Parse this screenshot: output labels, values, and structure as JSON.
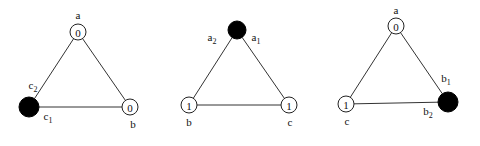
{
  "diagram": {
    "type": "three triangle graphs",
    "triangles": [
      {
        "id": "t1",
        "nodes": [
          {
            "name": "a",
            "value": "0",
            "filled": false,
            "x": 78,
            "y": 32,
            "r": 8,
            "label": "a",
            "label_x": 78,
            "label_y": 19
          },
          {
            "name": "b",
            "value": "0",
            "filled": false,
            "x": 130,
            "y": 107,
            "r": 8,
            "label": "b",
            "label_x": 133,
            "label_y": 128
          },
          {
            "name": "c",
            "value": "",
            "filled": true,
            "x": 29,
            "y": 107,
            "r": 10
          }
        ],
        "extra_labels": [
          {
            "text": "c",
            "sub": "2",
            "x": 33,
            "y": 89
          },
          {
            "text": "c",
            "sub": "1",
            "x": 48,
            "y": 120
          }
        ]
      },
      {
        "id": "t2",
        "nodes": [
          {
            "name": "a",
            "value": "",
            "filled": true,
            "x": 237,
            "y": 30,
            "r": 9
          },
          {
            "name": "b",
            "value": "1",
            "filled": false,
            "x": 189,
            "y": 105,
            "r": 8,
            "label": "b",
            "label_x": 189,
            "label_y": 126
          },
          {
            "name": "c",
            "value": "1",
            "filled": false,
            "x": 289,
            "y": 105,
            "r": 8,
            "label": "c",
            "label_x": 290,
            "label_y": 126
          }
        ],
        "extra_labels": [
          {
            "text": "a",
            "sub": "2",
            "x": 212,
            "y": 41
          },
          {
            "text": "a",
            "sub": "1",
            "x": 256,
            "y": 41
          }
        ]
      },
      {
        "id": "t3",
        "nodes": [
          {
            "name": "a",
            "value": "0",
            "filled": false,
            "x": 396,
            "y": 26,
            "r": 8,
            "label": "a",
            "label_x": 396,
            "label_y": 14
          },
          {
            "name": "c",
            "value": "1",
            "filled": false,
            "x": 346,
            "y": 104,
            "r": 8,
            "label": "c",
            "label_x": 347,
            "label_y": 125
          },
          {
            "name": "b",
            "value": "",
            "filled": true,
            "x": 448,
            "y": 102,
            "r": 10
          }
        ],
        "extra_labels": [
          {
            "text": "b",
            "sub": "1",
            "x": 446,
            "y": 82
          },
          {
            "text": "b",
            "sub": "2",
            "x": 428,
            "y": 115
          }
        ]
      }
    ]
  }
}
